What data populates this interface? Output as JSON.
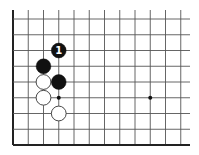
{
  "diagram": {
    "type": "go-board-fragment",
    "grid": {
      "columns": 12,
      "rows": 9,
      "x0": 13,
      "y0": 19,
      "dx": 15.25,
      "dy": 15.75,
      "line_top": 10,
      "line_right": 190,
      "edges": [
        "left",
        "bottom"
      ],
      "line_color": "#555555",
      "edge_color": "#222222"
    },
    "star_points": [
      {
        "col": 3,
        "row": 5
      },
      {
        "col": 9,
        "row": 5
      }
    ],
    "stones": [
      {
        "color": "black",
        "col": 3,
        "row": 2,
        "label": "1"
      },
      {
        "color": "black",
        "col": 2,
        "row": 3,
        "label": ""
      },
      {
        "color": "white",
        "col": 2,
        "row": 4,
        "label": ""
      },
      {
        "color": "black",
        "col": 3,
        "row": 4,
        "label": ""
      },
      {
        "color": "white",
        "col": 2,
        "row": 5,
        "label": ""
      },
      {
        "color": "white",
        "col": 3,
        "row": 6,
        "label": ""
      }
    ],
    "colors": {
      "black_stone": "#111111",
      "white_stone": "#ffffff",
      "white_stone_outline": "#333333",
      "label_on_black": "#ffffff"
    }
  }
}
